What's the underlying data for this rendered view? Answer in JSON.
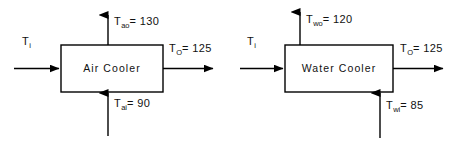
{
  "diagram": {
    "stroke_color": "#000000",
    "background_color": "#ffffff",
    "units_note": "",
    "units": [
      {
        "id": "air-cooler",
        "name": "Air Cooler",
        "box": {
          "x": 61,
          "y": 45,
          "w": 102,
          "h": 47
        },
        "streams": [
          {
            "id": "process-in",
            "label_symbol": "T",
            "label_sub": "i",
            "label_value": "",
            "label_text": "Ti",
            "direction": "right",
            "side": "left"
          },
          {
            "id": "process-out",
            "label_symbol": "T",
            "label_sub": "O",
            "label_value": "125",
            "label_text": "TO = 125",
            "direction": "right",
            "side": "right"
          },
          {
            "id": "air-out",
            "label_symbol": "T",
            "label_sub": "ao",
            "label_value": "130",
            "label_text": "Tao = 130",
            "direction": "up",
            "side": "top"
          },
          {
            "id": "air-in",
            "label_symbol": "T",
            "label_sub": "ai",
            "label_value": "90",
            "label_text": "Tai = 90",
            "direction": "up",
            "side": "bottom"
          }
        ]
      },
      {
        "id": "water-cooler",
        "name": "Water Cooler",
        "box": {
          "x": 285,
          "y": 45,
          "w": 108,
          "h": 47
        },
        "streams": [
          {
            "id": "process-in",
            "label_symbol": "T",
            "label_sub": "i",
            "label_value": "",
            "label_text": "Ti",
            "direction": "right",
            "side": "left"
          },
          {
            "id": "process-out",
            "label_symbol": "T",
            "label_sub": "O",
            "label_value": "125",
            "label_text": "TO = 125",
            "direction": "right",
            "side": "right"
          },
          {
            "id": "water-out",
            "label_symbol": "T",
            "label_sub": "wo",
            "label_value": "120",
            "label_text": "Two = 120",
            "direction": "up",
            "side": "top"
          },
          {
            "id": "water-in",
            "label_symbol": "T",
            "label_sub": "wi",
            "label_value": "85",
            "label_text": "Twi = 85",
            "direction": "up",
            "side": "bottom"
          }
        ]
      }
    ]
  },
  "labels": {
    "air_cooler": {
      "box_name": "Air Cooler",
      "inlet": "T",
      "inlet_sub": "i",
      "outlet": "T",
      "outlet_sub": "O",
      "outlet_eq": "= 125",
      "top": "T",
      "top_sub": "ao",
      "top_eq": "= 130",
      "bottom": "T",
      "bottom_sub": "ai",
      "bottom_eq": "= 90"
    },
    "water_cooler": {
      "box_name": "Water Cooler",
      "inlet": "T",
      "inlet_sub": "i",
      "outlet": "T",
      "outlet_sub": "O",
      "outlet_eq": "= 125",
      "top": "T",
      "top_sub": "wo",
      "top_eq": "= 120",
      "bottom": "T",
      "bottom_sub": "wi",
      "bottom_eq": "= 85"
    }
  }
}
